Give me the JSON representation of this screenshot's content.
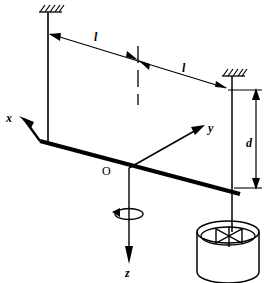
{
  "figure": {
    "type": "engineering-schematic",
    "background_color": "#ffffff",
    "line_color": "#000000"
  },
  "labels": {
    "axis_x": "x",
    "axis_y": "y",
    "axis_z": "z",
    "origin": "O",
    "length_left": "l",
    "length_right": "l",
    "depth": "d"
  },
  "elements": {
    "support_left": "fixed-support-hatched",
    "support_right": "fixed-support-hatched",
    "wire_left": "suspension-wire",
    "wire_right": "suspension-wire",
    "beam": "horizontal-rotating-beam",
    "centerline": "vertical-dashed-centerline",
    "rotation_indicator": "rotation-arrow-about-z",
    "vessel": "cylindrical-vessel",
    "impeller": "bowtie-impeller",
    "dimension_line_l": "horizontal-dimension-line",
    "dimension_line_d": "vertical-dimension-line"
  },
  "geometry": {
    "origin_point": [
      128,
      168
    ],
    "x_axis_tip": [
      20,
      118
    ],
    "y_axis_tip": [
      204,
      127
    ],
    "z_axis_tip": [
      128,
      263
    ],
    "wire_left_x": 48,
    "wire_right_x": 232,
    "beam_left_end": [
      40,
      142
    ],
    "beam_right_end": [
      238,
      194
    ],
    "dim_l_left_start": [
      50,
      33
    ],
    "dim_l_mid": [
      138,
      60
    ],
    "dim_l_right_end": [
      224,
      87
    ],
    "dim_d_x": 255,
    "dim_d_top": 90,
    "dim_d_bottom": 188,
    "vessel_cx": 228,
    "vessel_top_cy": 232,
    "vessel_rx": 31,
    "vessel_ry": 11,
    "vessel_bottom_cy": 272
  }
}
